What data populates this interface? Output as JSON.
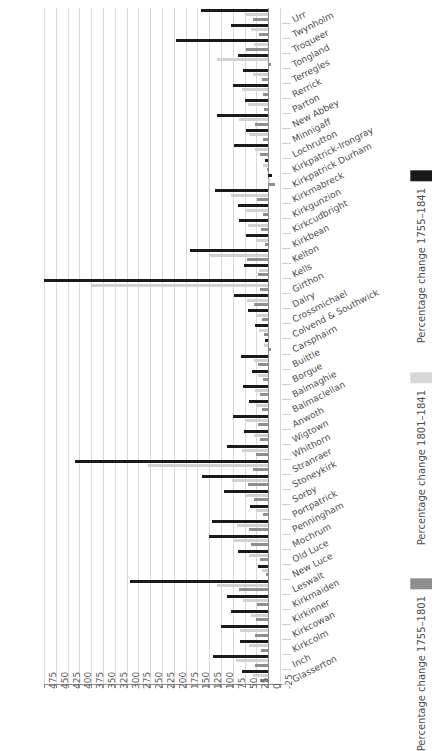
{
  "chart_data": {
    "type": "bar",
    "orientation": "horizontal",
    "title": "",
    "xlabel": "",
    "ylabel": "",
    "xlim": [
      -25,
      475
    ],
    "x_reversed": true,
    "grid": true,
    "xticks": [
      475,
      450,
      425,
      400,
      375,
      350,
      325,
      300,
      275,
      250,
      225,
      200,
      175,
      150,
      125,
      100,
      75,
      50,
      25,
      0,
      -25
    ],
    "legend_position": "right",
    "colors": {
      "series_1755_1841": "#1a1a1a",
      "series_1801_1841": "#d8d8d8",
      "series_1755_1801": "#8e8e8e",
      "gridline": "#d9d9d9",
      "axis": "#8a8a8a",
      "text": "#4d4d4d",
      "background": "#ffffff"
    },
    "categories": [
      "Urr",
      "Twynholm",
      "Troqueer",
      "Tongland",
      "Terregles",
      "Rerrick",
      "Parton",
      "New Abbey",
      "Minnigaff",
      "Lochrutton",
      "Kirkpatrick-Irongray",
      "Kirkpatrick Durham",
      "Kirkmabreck",
      "Kirkgunzion",
      "Kirkcudbright",
      "Kirkbean",
      "Kelton",
      "Kells",
      "Girthon",
      "Dalry",
      "Crossmichael",
      "Colvend & Southwick",
      "Carsphairn",
      "Buittle",
      "Borgue",
      "Balmaghie",
      "Balmaclellan",
      "Anwoth",
      "Wigtown",
      "Whithorn",
      "Stranraer",
      "Stoneykirk",
      "Sorby",
      "Portpatrick",
      "Penningham",
      "Mochrum",
      "Old Luce",
      "New Luce",
      "Leswalt",
      "Kirkmaiden",
      "Kirkinner",
      "Kirkcowan",
      "Kirkcolm",
      "Inch",
      "Glasserton"
    ],
    "series": [
      {
        "name": "Percentage change 1755–1841",
        "color": "#1a1a1a",
        "values": [
          143,
          78,
          195,
          63,
          53,
          75,
          50,
          108,
          47,
          72,
          7,
          -8,
          113,
          63,
          62,
          47,
          166,
          52,
          475,
          72,
          42,
          28,
          6,
          58,
          34,
          53,
          40,
          74,
          52,
          88,
          410,
          140,
          93,
          39,
          120,
          126,
          65,
          21,
          293,
          88,
          79,
          100,
          59,
          117,
          55
        ]
      },
      {
        "name": "Percentage change 1801–1841",
        "color": "#d8d8d8",
        "values": [
          48,
          37,
          31,
          109,
          33,
          55,
          43,
          62,
          40,
          28,
          11,
          -3,
          79,
          47,
          43,
          26,
          125,
          19,
          376,
          45,
          26,
          20,
          9,
          30,
          22,
          29,
          25,
          46,
          30,
          55,
          254,
          76,
          48,
          25,
          67,
          72,
          41,
          14,
          109,
          54,
          37,
          60,
          41,
          69,
          33
        ]
      },
      {
        "name": "Percentage change 1755–1801",
        "color": "#8e8e8e",
        "values": [
          33,
          20,
          48,
          -7,
          14,
          12,
          8,
          28,
          12,
          17,
          3,
          -14,
          23,
          12,
          16,
          6,
          45,
          21,
          17,
          31,
          14,
          8,
          -6,
          22,
          10,
          18,
          13,
          21,
          17,
          25,
          33,
          43,
          30,
          11,
          41,
          37,
          17,
          5,
          61,
          24,
          26,
          27,
          15,
          29,
          18
        ]
      }
    ]
  },
  "legend": {
    "items": [
      {
        "label": "Percentage change 1755–1841",
        "swatch": "sw0"
      },
      {
        "label": "Percentage change 1801–1841",
        "swatch": "sw1"
      },
      {
        "label": "Percentage change 1755–1801",
        "swatch": "sw2"
      }
    ]
  }
}
